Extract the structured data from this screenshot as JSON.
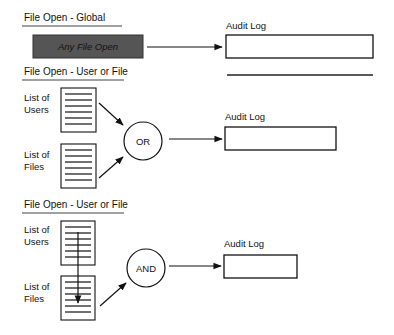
{
  "colors": {
    "line": "#111111",
    "filled_box": "#555555",
    "filled_box_text": "#1a1a1a",
    "background": "#ffffff"
  },
  "sections": [
    {
      "title": "File Open - Global",
      "source_box": {
        "label": "Any File Open",
        "style": "filled-dark"
      },
      "target": {
        "label": "Audit Log"
      }
    },
    {
      "title": "File Open - User or File",
      "lists": [
        {
          "label_line1": "List of",
          "label_line2": "Users"
        },
        {
          "label_line1": "List of",
          "label_line2": "Files"
        }
      ],
      "operator": "OR",
      "target": {
        "label": "Audit Log"
      }
    },
    {
      "title": "File Open - User or File",
      "lists": [
        {
          "label_line1": "List of",
          "label_line2": "Users"
        },
        {
          "label_line1": "List of",
          "label_line2": "Files"
        }
      ],
      "operator": "AND",
      "target": {
        "label": "Audit Log"
      }
    }
  ],
  "icons": {
    "list": "document-list-icon",
    "operator": "logic-gate-circle",
    "arrow": "arrow-right"
  }
}
